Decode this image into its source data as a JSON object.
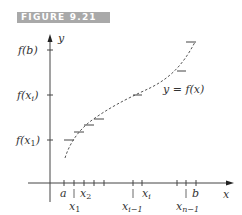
{
  "figure": {
    "label": "FIGURE 9.21",
    "header_color": "#a9a9a9"
  },
  "axes": {
    "x_label": "x",
    "y_label": "y"
  },
  "y_ticks": [
    {
      "label_main": "f(b)",
      "at": "f(b)"
    },
    {
      "label_main": "f(x",
      "sub": "i",
      "tail": ")"
    },
    {
      "label_main": "f(x",
      "sub": "1",
      "tail": ")"
    }
  ],
  "x_ticks": [
    {
      "label": "a",
      "row": "top"
    },
    {
      "label": "x",
      "sub": "1",
      "row": "bottom"
    },
    {
      "label": "x",
      "sub": "2",
      "row": "top"
    },
    {
      "label": "x",
      "sub": "i−1",
      "row": "bottom"
    },
    {
      "label": "x",
      "sub": "i",
      "row": "top"
    },
    {
      "label": "x",
      "sub": "n−1",
      "row": "bottom"
    },
    {
      "label": "b",
      "row": "top"
    }
  ],
  "curve_label": "y = f(x)",
  "colors": {
    "ink": "#333333",
    "curve": "#555555"
  }
}
